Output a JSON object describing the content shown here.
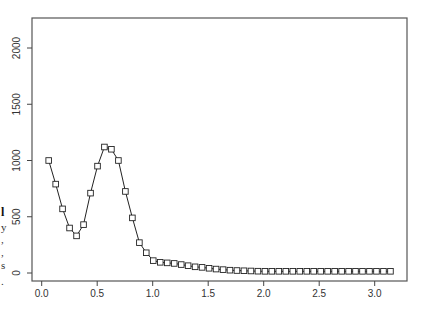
{
  "margin_fragments": [
    {
      "text": "l",
      "y": 206,
      "bold": true
    },
    {
      "text": "y",
      "y": 222,
      "bold": false
    },
    {
      "text": ",",
      "y": 234,
      "bold": false
    },
    {
      "text": ",",
      "y": 247,
      "bold": false
    },
    {
      "text": "s",
      "y": 260,
      "bold": false
    },
    {
      "text": ".",
      "y": 276,
      "bold": false
    }
  ],
  "chart_data": {
    "type": "line",
    "title": "",
    "xlabel": "",
    "ylabel": "",
    "xlim": [
      -0.09,
      3.29
    ],
    "ylim": [
      -70,
      2280
    ],
    "xticks": [
      0.0,
      0.5,
      1.0,
      1.5,
      2.0,
      2.5,
      3.0
    ],
    "xtick_labels": [
      "0.0",
      "0.5",
      "1.0",
      "1.5",
      "2.0",
      "2.5",
      "3.0"
    ],
    "yticks": [
      0,
      500,
      1000,
      1500,
      2000
    ],
    "ytick_labels": [
      "0",
      "500",
      "1000",
      "1500",
      "2000"
    ],
    "grid": false,
    "legend": null,
    "marker": "square",
    "series": [
      {
        "name": "series-1",
        "x": [
          0.063,
          0.126,
          0.188,
          0.251,
          0.314,
          0.377,
          0.44,
          0.503,
          0.565,
          0.628,
          0.691,
          0.754,
          0.817,
          0.88,
          0.942,
          1.005,
          1.068,
          1.131,
          1.194,
          1.257,
          1.319,
          1.382,
          1.445,
          1.508,
          1.571,
          1.634,
          1.696,
          1.759,
          1.822,
          1.885,
          1.948,
          2.011,
          2.073,
          2.136,
          2.199,
          2.262,
          2.325,
          2.388,
          2.45,
          2.513,
          2.576,
          2.639,
          2.702,
          2.765,
          2.827,
          2.89,
          2.953,
          3.016,
          3.079,
          3.142
        ],
        "values": [
          1000,
          790,
          570,
          400,
          330,
          430,
          710,
          950,
          1120,
          1100,
          1000,
          725,
          490,
          270,
          180,
          110,
          95,
          90,
          85,
          75,
          65,
          55,
          50,
          42,
          35,
          30,
          25,
          22,
          20,
          18,
          16,
          15,
          15,
          15,
          15,
          15,
          15,
          15,
          15,
          15,
          15,
          15,
          15,
          15,
          15,
          15,
          15,
          15,
          15,
          15
        ]
      }
    ]
  },
  "style": {
    "axis_color": "#444444",
    "line_color": "#222222",
    "marker_color": "#222222",
    "background": "#ffffff"
  }
}
